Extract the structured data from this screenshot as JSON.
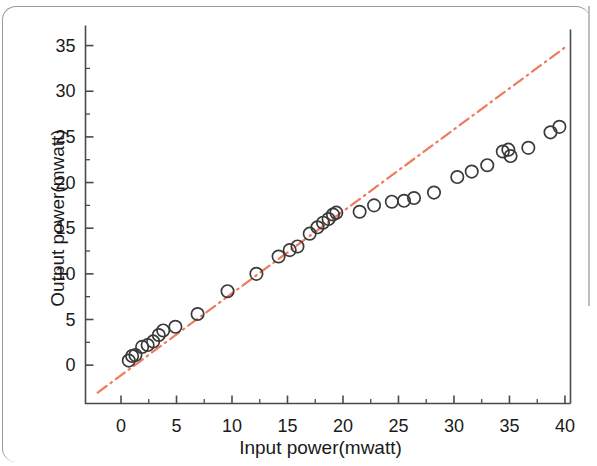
{
  "chart_data": {
    "type": "scatter",
    "title": "",
    "xlabel": "Input power(mwatt)",
    "ylabel": "Output power(mwatt)",
    "xlim": [
      -3.2,
      40.5
    ],
    "ylim": [
      -4.2,
      37.2
    ],
    "xticks": [
      0,
      5,
      10,
      15,
      20,
      25,
      30,
      35,
      40
    ],
    "xtick_labels": [
      "0",
      "5",
      "10",
      "15",
      "20",
      "25",
      "30",
      "35",
      "40"
    ],
    "yticks": [
      0,
      5,
      10,
      15,
      20,
      25,
      30,
      35
    ],
    "ytick_labels": [
      "0",
      "5",
      "10",
      "15",
      "20",
      "25",
      "30",
      "35"
    ],
    "minor_ticks": true,
    "grid": false,
    "legend": null,
    "marker": "open-circle",
    "marker_color": "#3a3a3a",
    "series": [
      {
        "name": "Measured output power",
        "marker": "open-circle",
        "points": [
          [
            0.7,
            0.5
          ],
          [
            1.0,
            1.0
          ],
          [
            1.3,
            1.1
          ],
          [
            1.9,
            2.0
          ],
          [
            2.4,
            2.2
          ],
          [
            2.9,
            2.6
          ],
          [
            3.4,
            3.3
          ],
          [
            3.8,
            3.8
          ],
          [
            4.9,
            4.2
          ],
          [
            6.9,
            5.6
          ],
          [
            9.6,
            8.1
          ],
          [
            12.2,
            10.0
          ],
          [
            14.2,
            11.9
          ],
          [
            15.2,
            12.6
          ],
          [
            15.9,
            13.0
          ],
          [
            17.0,
            14.4
          ],
          [
            17.7,
            15.1
          ],
          [
            18.2,
            15.6
          ],
          [
            18.7,
            16.0
          ],
          [
            19.1,
            16.5
          ],
          [
            19.4,
            16.7
          ],
          [
            21.5,
            16.8
          ],
          [
            22.8,
            17.5
          ],
          [
            24.4,
            17.9
          ],
          [
            25.5,
            18.0
          ],
          [
            26.4,
            18.3
          ],
          [
            28.2,
            18.9
          ],
          [
            30.3,
            20.6
          ],
          [
            31.6,
            21.2
          ],
          [
            33.0,
            21.9
          ],
          [
            34.4,
            23.4
          ],
          [
            34.9,
            23.6
          ],
          [
            35.1,
            22.9
          ],
          [
            36.7,
            23.8
          ],
          [
            38.7,
            25.5
          ],
          [
            39.5,
            26.1
          ]
        ]
      }
    ],
    "reference_line": {
      "name": "Ideal linear response",
      "style": "dash-dot",
      "color": "#ef7a5e",
      "x_start": -2.1,
      "y_start": -3.0,
      "x_end": 40.0,
      "y_end": 34.8,
      "slope": 0.897,
      "intercept": -1.12
    }
  }
}
